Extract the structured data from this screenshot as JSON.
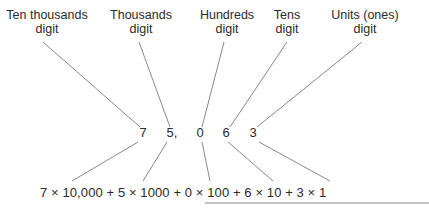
{
  "labels": [
    {
      "line1": "Ten thousands",
      "line2": "digit",
      "x": 47
    },
    {
      "line1": "Thousands",
      "line2": "digit",
      "x": 141
    },
    {
      "line1": "Hundreds",
      "line2": "digit",
      "x": 227
    },
    {
      "line1": "Tens",
      "line2": "digit",
      "x": 287
    },
    {
      "line1": "Units (ones)",
      "line2": "digit",
      "x": 365
    }
  ],
  "number": {
    "digits": [
      {
        "text": "7",
        "x": 143
      },
      {
        "text": "5,",
        "x": 172
      },
      {
        "text": "0",
        "x": 200
      },
      {
        "text": "6",
        "x": 226
      },
      {
        "text": "3",
        "x": 253
      }
    ]
  },
  "expansion": "7 × 10,000 + 5 × 1000 + 0 × 100 + 6 × 10 + 3 × 1",
  "colors": {
    "line": "#7a7a7a",
    "text": "#2a2a2a",
    "background": "#ffffff"
  }
}
